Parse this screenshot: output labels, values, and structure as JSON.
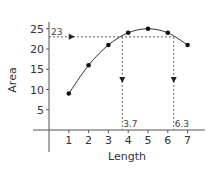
{
  "chart_data": {
    "type": "line",
    "title": "",
    "xlabel": "Length",
    "ylabel": "Area",
    "xlim": [
      0,
      7.5
    ],
    "ylim": [
      0,
      28
    ],
    "x_ticks": [
      1,
      2,
      3,
      4,
      5,
      6,
      7
    ],
    "y_ticks": [
      5,
      10,
      15,
      20,
      25
    ],
    "grid": false,
    "series": [
      {
        "name": "Area",
        "x": [
          1,
          2,
          3,
          4,
          5,
          6,
          7
        ],
        "values": [
          9,
          16,
          21,
          24,
          25,
          24,
          21
        ],
        "style": "smooth curve with markers"
      }
    ],
    "annotations": {
      "horizontal_line": {
        "y": 23,
        "label": "23"
      },
      "vertical_lines": [
        {
          "x": 3.7,
          "label": "3.7"
        },
        {
          "x": 6.3,
          "label": "6.3"
        }
      ]
    }
  }
}
